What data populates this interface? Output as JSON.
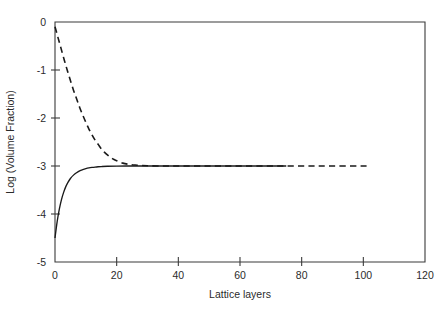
{
  "chart_data": {
    "type": "line",
    "title": "",
    "xlabel": "Lattice layers",
    "ylabel": "Log (Volume Fraction)",
    "xlim": [
      0,
      120
    ],
    "ylim": [
      -5,
      0
    ],
    "xticks": [
      0,
      20,
      40,
      60,
      80,
      100,
      120
    ],
    "xtick_labels": [
      "0",
      "20",
      "40",
      "60",
      "80",
      "100",
      "120"
    ],
    "yticks": [
      0,
      -1,
      -2,
      -3,
      -4,
      -5
    ],
    "ytick_labels": [
      "0",
      "-1",
      "-2",
      "-3",
      "-4",
      "-5"
    ],
    "grid": false,
    "legend": "none",
    "plateau_value": -3.0,
    "series": [
      {
        "name": "dashed-decay",
        "style": "dashed",
        "color": "#1a1a1a",
        "x_start": 0,
        "x_end": 102,
        "y_start": -0.1,
        "y_plateau": -3.0,
        "points": [
          [
            0,
            -0.1
          ],
          [
            1,
            -0.33
          ],
          [
            2,
            -0.56
          ],
          [
            3,
            -0.79
          ],
          [
            4,
            -1.01
          ],
          [
            5,
            -1.22
          ],
          [
            6,
            -1.42
          ],
          [
            7,
            -1.6
          ],
          [
            8,
            -1.78
          ],
          [
            9,
            -1.94
          ],
          [
            10,
            -2.09
          ],
          [
            11,
            -2.23
          ],
          [
            12,
            -2.35
          ],
          [
            13,
            -2.46
          ],
          [
            14,
            -2.55
          ],
          [
            15,
            -2.64
          ],
          [
            16,
            -2.71
          ],
          [
            17,
            -2.77
          ],
          [
            18,
            -2.82
          ],
          [
            19,
            -2.86
          ],
          [
            20,
            -2.89
          ],
          [
            22,
            -2.94
          ],
          [
            24,
            -2.965
          ],
          [
            26,
            -2.98
          ],
          [
            28,
            -2.99
          ],
          [
            30,
            -2.995
          ],
          [
            35,
            -3.0
          ],
          [
            40,
            -3.0
          ],
          [
            50,
            -3.0
          ],
          [
            60,
            -3.0
          ],
          [
            70,
            -3.0
          ],
          [
            80,
            -3.0
          ],
          [
            90,
            -3.0
          ],
          [
            102,
            -3.0
          ]
        ]
      },
      {
        "name": "solid-rise",
        "style": "solid",
        "color": "#1a1a1a",
        "x_start": 0,
        "x_end": 75,
        "y_start": -4.5,
        "y_plateau": -3.0,
        "points": [
          [
            0,
            -4.5
          ],
          [
            0.7,
            -4.16
          ],
          [
            1.4,
            -3.9
          ],
          [
            2.1,
            -3.7
          ],
          [
            2.8,
            -3.55
          ],
          [
            3.5,
            -3.43
          ],
          [
            4.2,
            -3.34
          ],
          [
            5,
            -3.26
          ],
          [
            6,
            -3.19
          ],
          [
            7,
            -3.14
          ],
          [
            8,
            -3.1
          ],
          [
            9,
            -3.075
          ],
          [
            10,
            -3.055
          ],
          [
            11,
            -3.04
          ],
          [
            12,
            -3.03
          ],
          [
            13,
            -3.022
          ],
          [
            14,
            -3.016
          ],
          [
            15,
            -3.012
          ],
          [
            17,
            -3.006
          ],
          [
            20,
            -3.002
          ],
          [
            25,
            -3.0
          ],
          [
            30,
            -3.0
          ],
          [
            40,
            -3.0
          ],
          [
            50,
            -3.0
          ],
          [
            60,
            -3.0
          ],
          [
            75,
            -3.0
          ]
        ]
      }
    ]
  },
  "axes": {
    "plot_left_px": 55,
    "plot_right_px": 425,
    "plot_top_px": 22,
    "plot_bottom_px": 262
  }
}
